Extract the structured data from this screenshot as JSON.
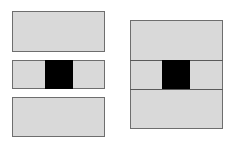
{
  "diagram": {
    "colors": {
      "fill": "#d9d9d9",
      "border": "#6e6e6e",
      "divider": "#5a5a5a",
      "block": "#000000",
      "background": "#ffffff"
    },
    "left_panel": {
      "boxes": [
        {
          "name": "top",
          "x": 12,
          "y": 11,
          "w": 93,
          "h": 41
        },
        {
          "name": "middle",
          "x": 12,
          "y": 60,
          "w": 93,
          "h": 29
        },
        {
          "name": "bottom",
          "x": 12,
          "y": 97,
          "w": 93,
          "h": 40
        }
      ],
      "black_square": {
        "x": 45,
        "y": 60,
        "w": 28,
        "h": 29
      }
    },
    "right_panel": {
      "box": {
        "x": 130,
        "y": 20,
        "w": 93,
        "h": 109
      },
      "dividers": [
        {
          "y": 60
        },
        {
          "y": 89
        }
      ],
      "black_square": {
        "x": 162,
        "y": 60,
        "w": 28,
        "h": 29
      }
    }
  }
}
